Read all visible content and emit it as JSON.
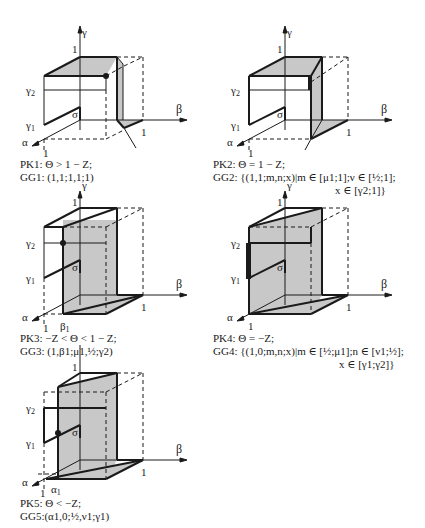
{
  "figure": {
    "axis_labels": {
      "gamma": "γ",
      "beta": "β",
      "alpha": "α",
      "sigma": "σ",
      "one": "1",
      "gamma1": "γ",
      "gamma2": "γ",
      "sub1": "1",
      "sub2": "2"
    },
    "panels": [
      {
        "id": "PK1",
        "condition": "PK1: Θ > 1 − Z;",
        "game": "GG1: (1,1;1,1;1)",
        "shaded_face": "top + vertical right wall",
        "marker": "dot at (γ2 top corner)"
      },
      {
        "id": "PK2",
        "condition": "PK2: Θ = 1 − Z;",
        "game_line1": "GG2: {(1,1;m,n;x)|m ∈ [μ1;1];ν ∈ [½;1];",
        "game_line2": "x ∈ [γ2;1]}",
        "marker": "thick segment on wall edge"
      },
      {
        "id": "PK3",
        "condition": "PK3: −Z < Θ < 1 − Z;",
        "game": "GG3: (1,β1;μ1,½;γ2)",
        "extra_label": "β1",
        "marker": "dot at (β1, γ2)"
      },
      {
        "id": "PK4",
        "condition": "PK4: Θ = −Z;",
        "game_line1": "GG4: {(1,0;m,n;x)|m ∈ [½;μ1];n ∈ [ν1;½];",
        "game_line2": "x ∈ [γ1;γ2]}",
        "marker": "thick segment on left edge between γ1 and γ2"
      },
      {
        "id": "PK5",
        "condition": "PK5: Θ < −Z;",
        "game": "GG5:(α1,0;½,ν1;γ1)",
        "extra_label": "α1",
        "marker": "dot at (α1, γ1)"
      }
    ],
    "colors": {
      "line": "#1a1a1a",
      "fill": "#c8c8c8",
      "background": "#ffffff"
    }
  }
}
